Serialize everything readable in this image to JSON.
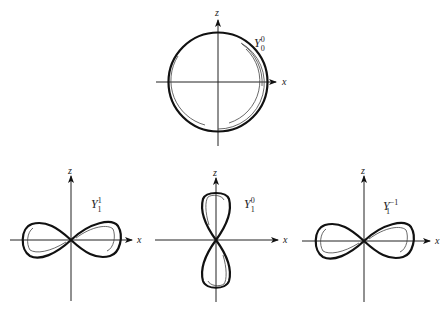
{
  "diagram": {
    "title": "",
    "panels": [
      {
        "id": "Y00",
        "label_base": "Y",
        "label_sup": "0",
        "label_sub": "0",
        "shape": "circle",
        "x_axis_label": "x",
        "z_axis_label": "z"
      },
      {
        "id": "Y11",
        "label_base": "Y",
        "label_sup": "1",
        "label_sub": "1",
        "shape": "horizontal-figure-eight",
        "x_axis_label": "x",
        "z_axis_label": "z"
      },
      {
        "id": "Y10",
        "label_base": "Y",
        "label_sup": "0",
        "label_sub": "1",
        "shape": "vertical-figure-eight",
        "x_axis_label": "x",
        "z_axis_label": "z"
      },
      {
        "id": "Y1m1",
        "label_base": "Y",
        "label_sup": "−1",
        "label_sub": "1",
        "shape": "horizontal-figure-eight",
        "x_axis_label": "x",
        "z_axis_label": "z"
      }
    ]
  }
}
